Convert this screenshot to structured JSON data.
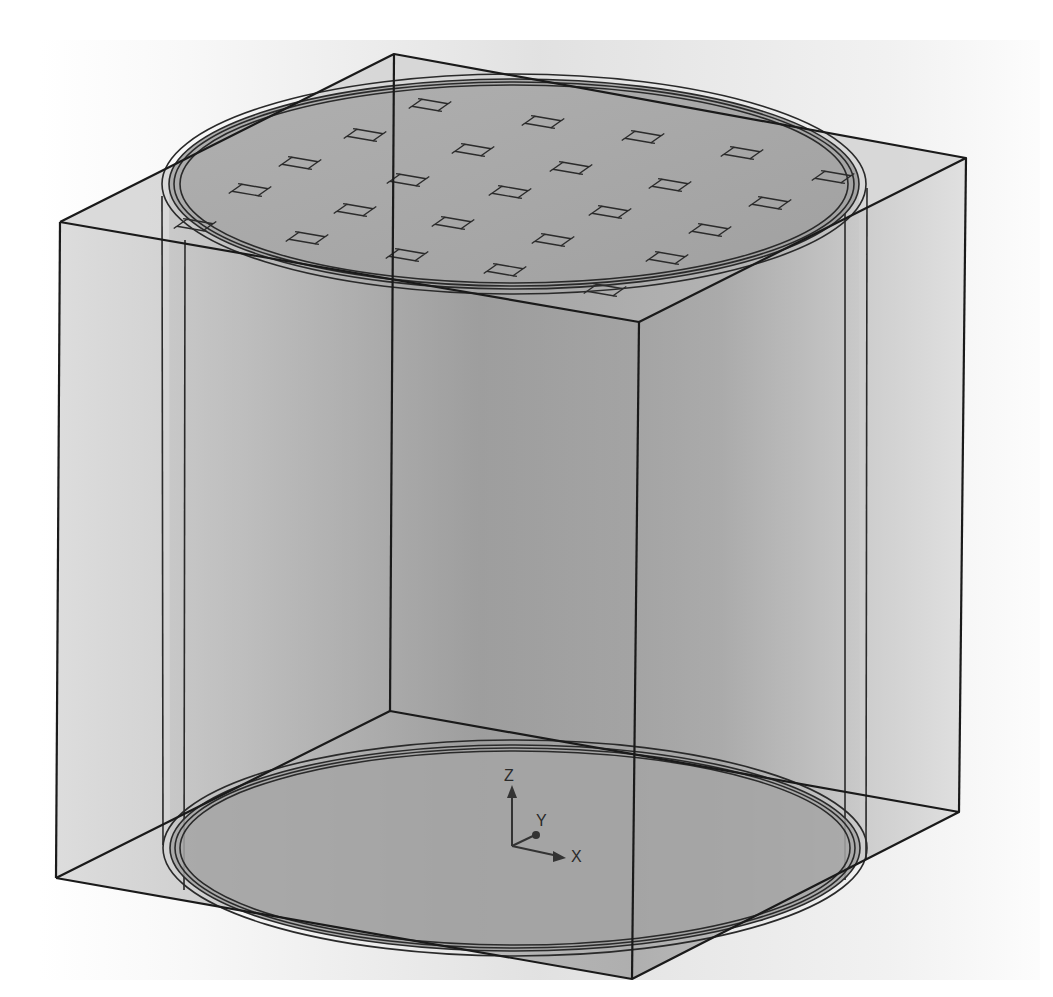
{
  "view": {
    "type": "3d-cad-viewport",
    "subject": "transparent rectangular box enclosing a cylinder with a grid of square patches on the top face",
    "background": {
      "left": "#ffffff",
      "center": "#c8c8c8",
      "right": "#f4f4f4"
    },
    "colors": {
      "edge": "#1a1a1a",
      "box_face": "#d2d2d2",
      "cylinder_face": "#9c9c9c",
      "ellipse_fill": "#a6a6a6"
    }
  },
  "box": {
    "top_back": [
      394,
      54
    ],
    "top_left": [
      60,
      222
    ],
    "top_right": [
      966,
      158
    ],
    "top_front": [
      639,
      322
    ],
    "bottom_back": [
      390,
      711
    ],
    "bottom_left": [
      56,
      878
    ],
    "bottom_right": [
      959,
      812
    ],
    "bottom_front": [
      632,
      979
    ]
  },
  "cylinder": {
    "top_ellipse": {
      "cx": 514,
      "cy": 184,
      "rx": 345,
      "ry": 105
    },
    "bottom_ellipse": {
      "cx": 515,
      "cy": 848,
      "rx": 345,
      "ry": 103
    },
    "ring_offsets": [
      0,
      5,
      10,
      14
    ]
  },
  "patches": [
    [
      430,
      105
    ],
    [
      543,
      122
    ],
    [
      643,
      137
    ],
    [
      742,
      153
    ],
    [
      833,
      177
    ],
    [
      365,
      135
    ],
    [
      473,
      150
    ],
    [
      571,
      168
    ],
    [
      670,
      185
    ],
    [
      770,
      203
    ],
    [
      300,
      163
    ],
    [
      408,
      180
    ],
    [
      510,
      192
    ],
    [
      610,
      212
    ],
    [
      710,
      230
    ],
    [
      250,
      190
    ],
    [
      355,
      210
    ],
    [
      453,
      223
    ],
    [
      553,
      240
    ],
    [
      667,
      258
    ],
    [
      307,
      238
    ],
    [
      407,
      255
    ],
    [
      505,
      270
    ],
    [
      605,
      290
    ],
    [
      195,
      225
    ]
  ],
  "triad": {
    "origin": [
      512,
      846
    ],
    "axes": [
      {
        "label": "Z",
        "end": [
          512,
          790
        ],
        "label_pos": [
          508,
          782
        ]
      },
      {
        "label": "Y",
        "end": [
          537,
          834
        ],
        "label_pos": [
          540,
          826
        ]
      },
      {
        "label": "X",
        "end": [
          562,
          855
        ],
        "label_pos": [
          572,
          861
        ]
      }
    ]
  }
}
